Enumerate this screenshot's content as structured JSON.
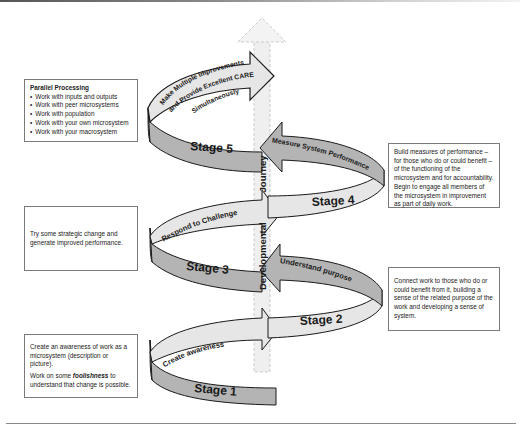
{
  "diagram": {
    "vertical_axis_label": "Developmental Journey",
    "vertical_axis_label_parts": [
      "Developmental",
      "Journey"
    ],
    "colors": {
      "band_light": "#e6e6e6",
      "band_dark": "#b4b4b4",
      "outline": "#1a1a1a",
      "axis_dashed": "#c8c8c8"
    },
    "stages": [
      {
        "id": 1,
        "label": "Stage 1",
        "arrow_text": "Create awareness"
      },
      {
        "id": 2,
        "label": "Stage 2",
        "arrow_text": "Understand purpose"
      },
      {
        "id": 3,
        "label": "Stage 3",
        "arrow_text": "Respond to Challenge"
      },
      {
        "id": 4,
        "label": "Stage 4",
        "arrow_text": "Measure System Performance"
      },
      {
        "id": 5,
        "label": "Stage 5",
        "arrow_text_lines": [
          "Make Multiple Improvements",
          "and Provide Excellent CARE",
          "Simultaneously"
        ]
      }
    ]
  },
  "notes": {
    "stage5": {
      "title": "Parallel Processing",
      "items": [
        "Work with inputs and outputs",
        "Work with peer microsystems",
        "Work with population",
        "Work with your own microsystem",
        "Work with your macrosystem"
      ]
    },
    "stage4": {
      "text": "Build measures of performance – for those who do or could benefit – of the functioning of the microsystem and for accountability. Begin to engage all members of the microsystem in improvement as part of daily work."
    },
    "stage3": {
      "text": "Try some strategic change and generate improved performance."
    },
    "stage2": {
      "text": "Connect work to those who do or could benefit from it, building a sense of the related purpose of the work and developing a sense of system."
    },
    "stage1": {
      "para1": "Create an awareness of work as a microsystem (description or picture).",
      "para2_before": "Work on some ",
      "para2_emphasis": "foolishness",
      "para2_after": " to understand that change is possible."
    }
  }
}
